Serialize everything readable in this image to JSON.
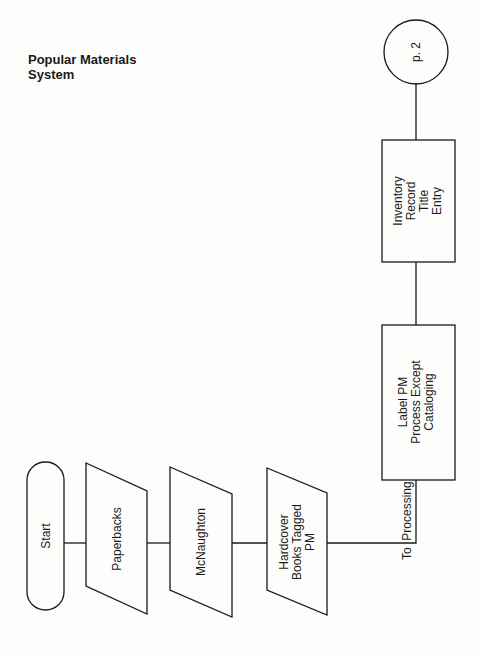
{
  "title": {
    "line1": "Popular Materials",
    "line2": "System"
  },
  "nodes": {
    "start": {
      "label": "Start",
      "shape": "terminator"
    },
    "paperbacks": {
      "label": "Paperbacks",
      "shape": "manual-input"
    },
    "mcnaughton": {
      "label": "McNaughton",
      "shape": "manual-input"
    },
    "hardcover": {
      "lines": [
        "Hardcover",
        "Books Tagged",
        "PM"
      ],
      "shape": "manual-input"
    },
    "label_pm": {
      "lines": [
        "Label PM",
        "Process Except",
        "Cataloging"
      ],
      "shape": "process"
    },
    "inventory": {
      "lines": [
        "Inventory",
        "Record",
        "Title",
        "Entry"
      ],
      "shape": "process"
    },
    "connector": {
      "label": "p. 2",
      "shape": "off-page-connector"
    }
  },
  "edges": {
    "to_processing": {
      "label": "To  Processing"
    }
  }
}
